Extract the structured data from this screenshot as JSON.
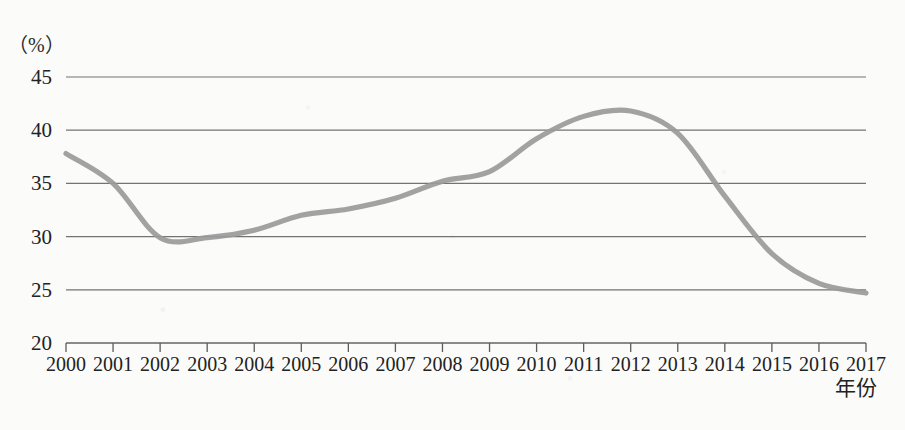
{
  "chart_data": {
    "type": "line",
    "title": "",
    "subtitle": "",
    "xlabel": "年份",
    "ylabel": "",
    "unit_label": "（%）",
    "xlim": [
      2000,
      2017
    ],
    "ylim": [
      20,
      45
    ],
    "grid": true,
    "grid_axis": "y",
    "legend": null,
    "legend_position": "none",
    "series_color": "#9a9a9a",
    "x": [
      2000,
      2001,
      2002,
      2003,
      2004,
      2005,
      2006,
      2007,
      2008,
      2009,
      2010,
      2011,
      2012,
      2013,
      2014,
      2015,
      2016,
      2017
    ],
    "categories": [
      "2000",
      "2001",
      "2002",
      "2003",
      "2004",
      "2005",
      "2006",
      "2007",
      "2008",
      "2009",
      "2010",
      "2011",
      "2012",
      "2013",
      "2014",
      "2015",
      "2016",
      "2017"
    ],
    "values": [
      37.8,
      35.0,
      29.9,
      29.9,
      30.6,
      32.0,
      32.6,
      33.6,
      35.2,
      36.1,
      39.2,
      41.3,
      41.8,
      39.7,
      33.8,
      28.4,
      25.6,
      24.7
    ],
    "series": [
      {
        "name": "",
        "color": "#9a9a9a",
        "values": [
          37.8,
          35.0,
          29.9,
          29.9,
          30.6,
          32.0,
          32.6,
          33.6,
          35.2,
          36.1,
          39.2,
          41.3,
          41.8,
          39.7,
          33.8,
          28.4,
          25.6,
          24.7
        ]
      }
    ],
    "yticks": [
      20,
      25,
      30,
      35,
      40,
      45
    ],
    "ytick_labels": [
      "20",
      "25",
      "30",
      "35",
      "40",
      "45"
    ],
    "xticks": [
      2000,
      2001,
      2002,
      2003,
      2004,
      2005,
      2006,
      2007,
      2008,
      2009,
      2010,
      2011,
      2012,
      2013,
      2014,
      2015,
      2016,
      2017
    ],
    "annotations": []
  }
}
